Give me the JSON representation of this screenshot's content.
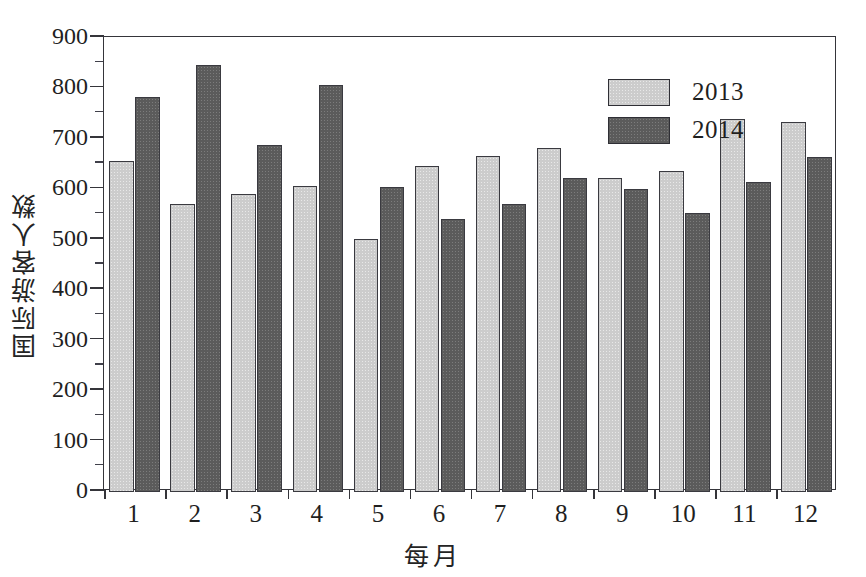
{
  "chart_data": {
    "type": "bar",
    "title": "",
    "xlabel": "每月",
    "ylabel": "国际游客人数",
    "categories": [
      "1",
      "2",
      "3",
      "4",
      "5",
      "6",
      "7",
      "8",
      "9",
      "10",
      "11",
      "12"
    ],
    "series": [
      {
        "name": "2013",
        "color": "#cccccc",
        "values": [
          655,
          568,
          588,
          605,
          500,
          645,
          665,
          680,
          620,
          635,
          738,
          732
        ]
      },
      {
        "name": "2014",
        "color": "#5b5b5b",
        "values": [
          782,
          845,
          685,
          805,
          603,
          540,
          568,
          620,
          598,
          552,
          613,
          662
        ]
      }
    ],
    "ylim": [
      0,
      900
    ],
    "ytick_step": 100,
    "yminor_step": 50,
    "ytick_labels": [
      "0",
      "100",
      "200",
      "300",
      "400",
      "500",
      "600",
      "700",
      "800",
      "900"
    ],
    "grid": false,
    "legend_position": "top-right-inside"
  },
  "axes": {
    "y_axis_title": "国际游客人数",
    "x_axis_title": "每月"
  },
  "legend": {
    "entries": [
      {
        "label": "2013",
        "swatch_color": "#cccccc"
      },
      {
        "label": "2014",
        "swatch_color": "#5b5b5b"
      }
    ]
  },
  "colors": {
    "series_2013": "#cccccc",
    "series_2014": "#5b5b5b",
    "axis": "#35353a",
    "text": "#1f1f1f",
    "background": "#ffffff"
  }
}
